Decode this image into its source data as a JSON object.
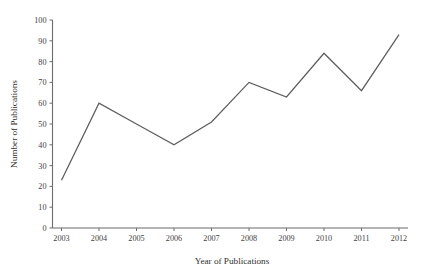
{
  "chart_data": {
    "type": "line",
    "title": "",
    "xlabel": "Year of Publications",
    "ylabel": "Number of Publications",
    "categories": [
      "2003",
      "2004",
      "2005",
      "2006",
      "2007",
      "2008",
      "2009",
      "2010",
      "2011",
      "2012"
    ],
    "x": [
      2003,
      2004,
      2005,
      2006,
      2007,
      2008,
      2009,
      2010,
      2011,
      2012
    ],
    "values": [
      23,
      60,
      50,
      40,
      51,
      70,
      63,
      84,
      66,
      93
    ],
    "series": [
      {
        "name": "Number of Publications",
        "values": [
          23,
          60,
          50,
          40,
          51,
          70,
          63,
          84,
          66,
          93
        ]
      }
    ],
    "ylim": [
      0,
      100
    ],
    "xlim": [
      2003,
      2012
    ],
    "ytick_labels": [
      "0",
      "10",
      "20",
      "30",
      "40",
      "50",
      "60",
      "70",
      "80",
      "90",
      "100"
    ],
    "yticks": [
      0,
      10,
      20,
      30,
      40,
      50,
      60,
      70,
      80,
      90,
      100
    ],
    "xtick_labels": [
      "2003",
      "2004",
      "2005",
      "2006",
      "2007",
      "2008",
      "2009",
      "2010",
      "2011",
      "2012"
    ],
    "grid": false,
    "legend": false,
    "legend_position": "none",
    "line_color": "#5d5d5d",
    "axis_color": "#6b6b6b",
    "background_color": "#ffffff",
    "markers": false,
    "annotations": []
  }
}
